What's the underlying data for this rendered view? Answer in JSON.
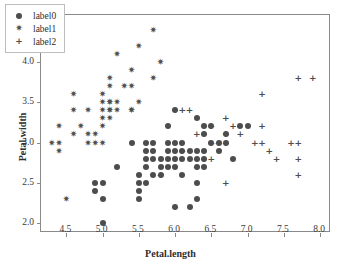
{
  "chart_data": {
    "type": "scatter",
    "title": "",
    "xlabel": "Petal.length",
    "ylabel": "Petal.width",
    "xlim": [
      4.15,
      8.15
    ],
    "ylim": [
      1.88,
      4.58
    ],
    "xticks": [
      "4.5",
      "5.0",
      "5.5",
      "6.0",
      "6.5",
      "7.0",
      "7.5",
      "8.0"
    ],
    "xtick_values": [
      4.5,
      5.0,
      5.5,
      6.0,
      6.5,
      7.0,
      7.5,
      8.0
    ],
    "yticks": [
      "2.0",
      "2.5",
      "3.0",
      "3.5",
      "4.0",
      "4.5"
    ],
    "ytick_values": [
      2.0,
      2.5,
      3.0,
      3.5,
      4.0,
      4.5
    ],
    "grid": false,
    "legend_position": "upper-left",
    "marker_color": "#4d4d4d",
    "frame_color": "#8a8a8a",
    "background": "#ffffff",
    "series": [
      {
        "name": "label0",
        "marker": "circle",
        "color": "#4d4d4d",
        "points": [
          [
            4.9,
            2.5
          ],
          [
            4.9,
            2.4
          ],
          [
            5.0,
            2.3
          ],
          [
            5.0,
            2.0
          ],
          [
            5.0,
            2.5
          ],
          [
            5.2,
            2.7
          ],
          [
            5.4,
            3.0
          ],
          [
            5.5,
            2.6
          ],
          [
            5.5,
            2.5
          ],
          [
            5.5,
            2.4
          ],
          [
            5.5,
            2.3
          ],
          [
            5.6,
            3.0
          ],
          [
            5.6,
            2.9
          ],
          [
            5.6,
            2.8
          ],
          [
            5.6,
            2.7
          ],
          [
            5.6,
            2.5
          ],
          [
            5.7,
            3.0
          ],
          [
            5.7,
            2.9
          ],
          [
            5.7,
            2.8
          ],
          [
            5.7,
            2.6
          ],
          [
            5.8,
            2.7
          ],
          [
            5.8,
            2.6
          ],
          [
            5.8,
            2.8
          ],
          [
            5.9,
            3.2
          ],
          [
            5.9,
            3.0
          ],
          [
            5.9,
            2.9
          ],
          [
            5.9,
            2.8
          ],
          [
            5.9,
            2.7
          ],
          [
            6.0,
            3.4
          ],
          [
            6.0,
            3.0
          ],
          [
            6.0,
            2.9
          ],
          [
            6.0,
            2.8
          ],
          [
            6.0,
            2.7
          ],
          [
            6.0,
            2.2
          ],
          [
            6.1,
            3.0
          ],
          [
            6.1,
            2.9
          ],
          [
            6.1,
            2.8
          ],
          [
            6.1,
            2.6
          ],
          [
            6.2,
            2.9
          ],
          [
            6.2,
            2.8
          ],
          [
            6.2,
            2.2
          ],
          [
            6.3,
            3.3
          ],
          [
            6.3,
            2.9
          ],
          [
            6.3,
            2.8
          ],
          [
            6.3,
            2.7
          ],
          [
            6.3,
            2.5
          ],
          [
            6.3,
            2.3
          ],
          [
            6.4,
            3.2
          ],
          [
            6.4,
            3.1
          ],
          [
            6.4,
            2.9
          ],
          [
            6.4,
            2.8
          ],
          [
            6.5,
            3.2
          ],
          [
            6.5,
            3.0
          ],
          [
            6.6,
            3.0
          ],
          [
            6.6,
            2.9
          ],
          [
            6.7,
            3.1
          ],
          [
            6.7,
            3.0
          ],
          [
            6.8,
            2.8
          ],
          [
            6.9,
            3.2
          ],
          [
            7.0,
            3.2
          ],
          [
            6.4,
            2.7
          ]
        ]
      },
      {
        "name": "label1",
        "marker": "star",
        "color": "#4d4d4d",
        "points": [
          [
            4.3,
            3.0
          ],
          [
            4.4,
            3.2
          ],
          [
            4.4,
            3.0
          ],
          [
            4.4,
            2.9
          ],
          [
            4.5,
            2.3
          ],
          [
            4.6,
            3.6
          ],
          [
            4.6,
            3.4
          ],
          [
            4.6,
            3.1
          ],
          [
            4.7,
            3.2
          ],
          [
            4.8,
            3.4
          ],
          [
            4.8,
            3.1
          ],
          [
            4.8,
            3.0
          ],
          [
            4.9,
            3.1
          ],
          [
            4.9,
            3.0
          ],
          [
            5.0,
            3.6
          ],
          [
            5.0,
            3.5
          ],
          [
            5.0,
            3.4
          ],
          [
            5.0,
            3.3
          ],
          [
            5.0,
            3.2
          ],
          [
            5.0,
            3.0
          ],
          [
            5.1,
            3.8
          ],
          [
            5.1,
            3.7
          ],
          [
            5.1,
            3.5
          ],
          [
            5.1,
            3.4
          ],
          [
            5.1,
            3.3
          ],
          [
            5.1,
            3.5
          ],
          [
            5.2,
            4.1
          ],
          [
            5.2,
            3.5
          ],
          [
            5.2,
            3.4
          ],
          [
            5.3,
            3.7
          ],
          [
            5.4,
            3.9
          ],
          [
            5.4,
            3.7
          ],
          [
            5.4,
            3.4
          ],
          [
            5.5,
            4.2
          ],
          [
            5.5,
            3.5
          ],
          [
            5.7,
            4.4
          ],
          [
            5.7,
            3.8
          ],
          [
            5.8,
            4.0
          ],
          [
            5.1,
            3.4
          ],
          [
            5.4,
            3.4
          ]
        ]
      },
      {
        "name": "label2",
        "marker": "plus",
        "color": "#4d4d4d",
        "points": [
          [
            5.8,
            2.6
          ],
          [
            6.0,
            3.4
          ],
          [
            6.1,
            3.4
          ],
          [
            6.1,
            2.9
          ],
          [
            6.2,
            3.4
          ],
          [
            6.3,
            3.1
          ],
          [
            6.3,
            2.8
          ],
          [
            6.3,
            2.7
          ],
          [
            6.4,
            3.2
          ],
          [
            6.4,
            2.8
          ],
          [
            6.5,
            3.2
          ],
          [
            6.5,
            3.0
          ],
          [
            6.6,
            3.0
          ],
          [
            6.7,
            3.3
          ],
          [
            6.7,
            3.1
          ],
          [
            6.7,
            3.0
          ],
          [
            6.7,
            2.5
          ],
          [
            6.8,
            3.2
          ],
          [
            6.9,
            3.1
          ],
          [
            7.1,
            3.0
          ],
          [
            7.2,
            3.6
          ],
          [
            7.2,
            3.2
          ],
          [
            7.2,
            3.0
          ],
          [
            7.3,
            2.9
          ],
          [
            7.4,
            2.8
          ],
          [
            7.6,
            3.0
          ],
          [
            7.7,
            3.8
          ],
          [
            7.7,
            3.0
          ],
          [
            7.7,
            2.8
          ],
          [
            7.7,
            2.6
          ],
          [
            7.9,
            3.8
          ],
          [
            6.4,
            3.1
          ],
          [
            6.5,
            2.8
          ],
          [
            6.0,
            2.2
          ]
        ]
      }
    ]
  },
  "legend": {
    "entries": [
      {
        "label": "label0",
        "marker": "circle"
      },
      {
        "label": "label1",
        "marker": "star"
      },
      {
        "label": "label2",
        "marker": "plus"
      }
    ]
  }
}
